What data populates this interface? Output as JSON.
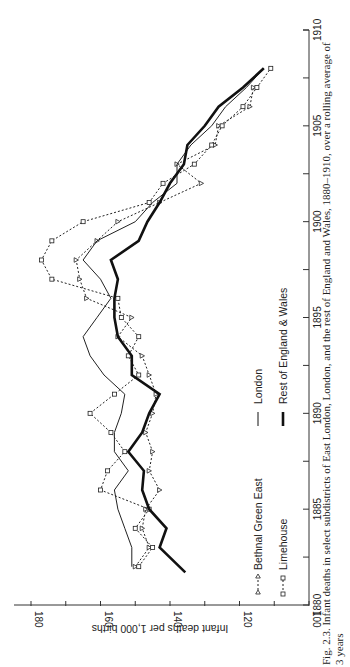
{
  "chart_data": {
    "type": "line",
    "orientation": "rotated-90-clockwise",
    "title": "",
    "xlabel": "",
    "ylabel": "Infant deaths per 1,000 births",
    "xlim": [
      1880,
      1910
    ],
    "ylim": [
      100,
      180
    ],
    "x_ticks": [
      1880,
      1885,
      1890,
      1895,
      1900,
      1905,
      1910
    ],
    "x_minor_ticks": [
      1882.5,
      1887.5,
      1892.5,
      1897.5,
      1902.5,
      1907.5
    ],
    "y_ticks": [
      100,
      120,
      140,
      160,
      180
    ],
    "y_minor_ticks": [
      110,
      130,
      150,
      170
    ],
    "grid": false,
    "legend_placement": "center",
    "series": [
      {
        "name": "Bethnal Green East",
        "style": "dotted-triangle",
        "x": [
          1882,
          1883,
          1884,
          1885,
          1886,
          1887,
          1888,
          1889,
          1890,
          1891,
          1892,
          1893,
          1894,
          1895,
          1896,
          1897,
          1898,
          1899,
          1900,
          1901,
          1902,
          1903,
          1904,
          1905,
          1906,
          1907
        ],
        "values": [
          150,
          146,
          148,
          147,
          143,
          146,
          145,
          147,
          145,
          144,
          146,
          148,
          155,
          151,
          164,
          166,
          167,
          161,
          155,
          143,
          131,
          138,
          127,
          126,
          117,
          116
        ]
      },
      {
        "name": "Limehouse",
        "style": "dotted-square",
        "x": [
          1882,
          1883,
          1884,
          1885,
          1886,
          1887,
          1888,
          1889,
          1890,
          1891,
          1892,
          1893,
          1894,
          1895,
          1896,
          1897,
          1898,
          1899,
          1900,
          1901,
          1902,
          1903,
          1904,
          1905,
          1906,
          1907,
          1908
        ],
        "values": [
          149,
          145,
          150,
          146,
          160,
          158,
          153,
          157,
          163,
          156,
          149,
          152,
          149,
          154,
          155,
          174,
          177,
          174,
          165,
          146,
          142,
          133,
          128,
          125,
          119,
          115,
          111
        ]
      },
      {
        "name": "London",
        "style": "thin-solid",
        "x": [
          1882,
          1883,
          1884,
          1885,
          1886,
          1887,
          1888,
          1889,
          1890,
          1891,
          1892,
          1893,
          1894,
          1895,
          1896,
          1897,
          1898,
          1899,
          1900,
          1901,
          1902,
          1903,
          1904,
          1905,
          1906,
          1907,
          1908
        ],
        "values": [
          151,
          151,
          153,
          155,
          156,
          152,
          156,
          156,
          154,
          153,
          159,
          163,
          165,
          161,
          157,
          160,
          165,
          161,
          150,
          145,
          138,
          138,
          134,
          128,
          124,
          118,
          113
        ]
      },
      {
        "name": "Rest of England & Wales",
        "style": "thick-solid",
        "x": [
          1881.7,
          1883,
          1884,
          1885,
          1886,
          1887,
          1888,
          1889,
          1890,
          1891,
          1892,
          1893,
          1894,
          1895,
          1896,
          1897,
          1898,
          1899,
          1900,
          1901,
          1902,
          1903,
          1904,
          1905,
          1906,
          1907,
          1908
        ],
        "values": [
          135.6,
          143,
          141,
          146,
          148,
          147.5,
          152,
          148,
          146,
          143,
          151,
          151,
          155,
          156,
          156,
          155,
          157,
          149,
          146.5,
          143,
          140,
          136,
          135,
          130,
          126,
          119,
          113
        ]
      }
    ]
  },
  "caption": {
    "line1": "Fig. 2.3. Infant deaths in select subdistricts of East London, London, and the rest of England and Wales, 1880–1910, over a rolling average of",
    "line2": "3 years"
  }
}
